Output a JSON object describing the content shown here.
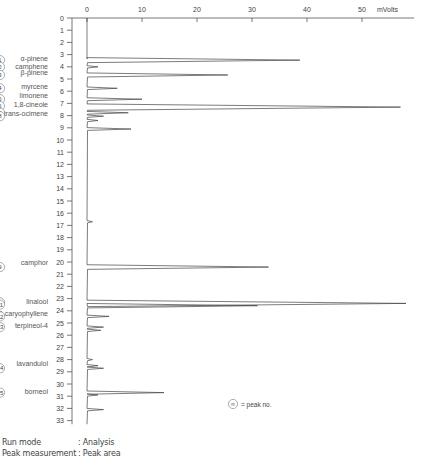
{
  "chart_data": {
    "type": "line",
    "title": "",
    "orientation": "vertical-time",
    "xlabel": "mVolts",
    "ylabel": "Retention time (min)",
    "x_ticks": [
      0,
      10,
      20,
      30,
      40,
      50
    ],
    "x_unit_label": "mVolts",
    "y_ticks": [
      0,
      1,
      2,
      3,
      4,
      5,
      6,
      7,
      8,
      9,
      10,
      11,
      12,
      13,
      14,
      15,
      16,
      17,
      18,
      19,
      20,
      21,
      22,
      23,
      24,
      25,
      26,
      27,
      28,
      29,
      30,
      31,
      32,
      33
    ],
    "ylim": [
      0,
      33.5
    ],
    "xlim": [
      0,
      58
    ],
    "grid": false,
    "peaks": [
      {
        "no": 1,
        "rt": 3.454,
        "label": "3.454",
        "height_mv": 38.7,
        "compound": "α-pinene"
      },
      {
        "no": 2,
        "rt": 4.004,
        "label": "4.004",
        "height_mv": 2.0,
        "compound": "camphene"
      },
      {
        "no": 3,
        "rt": 4.67,
        "label": "4.670",
        "height_mv": 25.6,
        "compound": "β-pinene"
      },
      {
        "no": 4,
        "rt": 5.762,
        "label": "5.762",
        "height_mv": 5.5,
        "compound": "myrcene"
      },
      {
        "no": 5,
        "rt": 6.657,
        "label": "6.657",
        "height_mv": 10.0,
        "compound": "limonene"
      },
      {
        "no": 6,
        "rt": 7.304,
        "label": "7.304",
        "height_mv": 57.0,
        "compound": "1,8-cineole"
      },
      {
        "no": 7,
        "rt": 7.768,
        "label": "7.768",
        "height_mv": 7.5,
        "compound": "trans-ocimene"
      },
      {
        "no": 8,
        "rt": 8.047,
        "label": "8.047",
        "height_mv": 3.0,
        "compound": ""
      },
      {
        "no": 9,
        "rt": 20.414,
        "label": "20.414",
        "height_mv": 33.0,
        "compound": "camphor"
      },
      {
        "no": 10,
        "rt": 23.393,
        "label": "23.393",
        "height_mv": 58.0,
        "compound": "linalool"
      },
      {
        "no": 11,
        "rt": 23.581,
        "label": "23.581",
        "height_mv": 31.0,
        "compound": ""
      },
      {
        "no": 12,
        "rt": 24.457,
        "label": "24.457",
        "height_mv": 4.0,
        "compound": "β-caryophyllene"
      },
      {
        "no": 13,
        "rt": 25.336,
        "label": "25.336",
        "height_mv": 3.0,
        "compound": "terpineol-4"
      },
      {
        "no": 14,
        "rt": 28.71,
        "label": "28.710",
        "height_mv": 3.0,
        "compound": "lavandulol"
      },
      {
        "no": 15,
        "rt": 30.706,
        "label": "30.706",
        "height_mv": 14.0,
        "compound": "borneol"
      }
    ],
    "minor_peaks": [
      {
        "rt": 9.1,
        "height_mv": 8.0
      },
      {
        "rt": 8.4,
        "height_mv": 2.0
      },
      {
        "rt": 16.7,
        "height_mv": 1.0
      },
      {
        "rt": 25.6,
        "height_mv": 2.5
      },
      {
        "rt": 28.5,
        "height_mv": 2.0
      },
      {
        "rt": 28.0,
        "height_mv": 1.0
      },
      {
        "rt": 30.9,
        "height_mv": 2.0
      },
      {
        "rt": 32.1,
        "height_mv": 3.0
      }
    ],
    "compound_labels": [
      {
        "text": "α-pinene",
        "rt": 3.35
      },
      {
        "text": "camphene",
        "rt": 3.95
      },
      {
        "text": "β-pinene",
        "rt": 4.5
      },
      {
        "text": "myrcene",
        "rt": 5.6
      },
      {
        "text": "limonene",
        "rt": 6.35
      },
      {
        "text": "1,8-cineole",
        "rt": 7.1
      },
      {
        "text": "trans-ocimene",
        "rt": 7.85
      },
      {
        "text": "camphor",
        "rt": 20.0
      },
      {
        "text": "linalool",
        "rt": 23.2
      },
      {
        "text": "β-caryophyllene",
        "rt": 24.2
      },
      {
        "text": "terpineol-4",
        "rt": 25.2
      },
      {
        "text": "lavandulol",
        "rt": 28.3
      },
      {
        "text": "borneol",
        "rt": 30.6
      }
    ],
    "legend": {
      "symbol": "n",
      "text": "= peak no."
    }
  },
  "footer": {
    "run_mode_key": "Run mode",
    "run_mode_val": ": Analysis",
    "peak_meas_key": "Peak measurement",
    "peak_meas_val": ": Peak area"
  }
}
